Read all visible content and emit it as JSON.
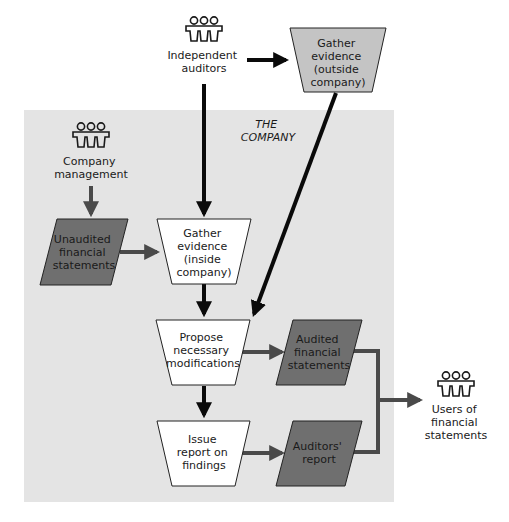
{
  "colors": {
    "company_region": "#e4e4e4",
    "process_fill": "#ffffff",
    "outside_process_fill": "#c4c4c4",
    "document_fill": "#6f6f6f",
    "black_arrow": "#0a0a0a",
    "gray_arrow": "#4a4a4a",
    "outline": "#222222"
  },
  "region": {
    "label_lines": [
      "THE",
      "COMPANY"
    ]
  },
  "actors": {
    "independent_auditors": {
      "icon": "people-group-icon",
      "lines": [
        "Independent",
        "auditors"
      ]
    },
    "company_management": {
      "icon": "people-group-icon",
      "lines": [
        "Company",
        "management"
      ]
    },
    "users": {
      "icon": "people-group-icon",
      "lines": [
        "Users of",
        "financial",
        "statements"
      ]
    }
  },
  "processes": {
    "gather_outside": {
      "lines": [
        "Gather",
        "evidence",
        "(outside",
        "company)"
      ]
    },
    "gather_inside": {
      "lines": [
        "Gather",
        "evidence",
        "(inside",
        "company)"
      ]
    },
    "propose": {
      "lines": [
        "Propose",
        "necessary",
        "modifications"
      ]
    },
    "issue_report": {
      "lines": [
        "Issue",
        "report on",
        "findings"
      ]
    }
  },
  "documents": {
    "unaudited": {
      "lines": [
        "Unaudited",
        "financial",
        "statements"
      ]
    },
    "audited": {
      "lines": [
        "Audited",
        "financial",
        "statements"
      ]
    },
    "auditors_report": {
      "lines": [
        "Auditors'",
        "report"
      ]
    }
  }
}
